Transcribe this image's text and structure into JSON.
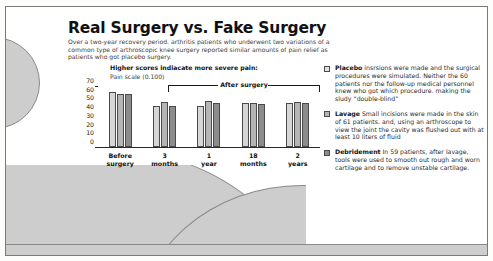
{
  "header": {
    "title": "Real Surgery vs. Fake Surgery",
    "subtitle": "Over a two-year recovery period. arthritis patients who underwent two variations of a common type of arthroscopic knee surgery reported similar amounts of pain relief as patients who got placebo surgery."
  },
  "notes": {
    "scores": "Higher scores indiacate more severe pain:",
    "scale": "Pain scale (0.100)",
    "bracket_label": "After surgery"
  },
  "chart_data": {
    "type": "bar",
    "title": "Real Surgery vs. Fake Surgery",
    "xlabel": "",
    "ylabel": "Pain scale (0.100)",
    "ylim": [
      0,
      70
    ],
    "yticks": [
      0,
      10,
      20,
      30,
      40,
      50,
      60,
      70
    ],
    "grid": false,
    "legend_position": "right",
    "categories": [
      "Before surgery",
      "3 months",
      "1 year",
      "18 months",
      "2 years"
    ],
    "category_lines": [
      [
        "Before",
        "surgery"
      ],
      [
        "3",
        "months"
      ],
      [
        "1",
        "year"
      ],
      [
        "18",
        "months"
      ],
      [
        "2",
        "years"
      ]
    ],
    "series": [
      {
        "name": "Placebo",
        "color": "#d6d6d6",
        "values": [
          64,
          48,
          48,
          51,
          51
        ]
      },
      {
        "name": "Lavage",
        "color": "#b5b5b5",
        "values": [
          62,
          52,
          54,
          51,
          52
        ]
      },
      {
        "name": "Debridement",
        "color": "#8c8c8c",
        "values": [
          62,
          48,
          51,
          50,
          51
        ]
      }
    ]
  },
  "legend": [
    {
      "name": "Placebo",
      "color": "#e2e2e2",
      "body": " insrsions were made and the surgical procedures were simulated. Neither the 60 patients nor the follow-up medical personnel knew who got which procedure. making the sludy “double-blind”"
    },
    {
      "name": "Lavage",
      "color": "#b5b5b5",
      "body": " Small incisions were made in the skin of 61 patients. and, using an arthroscope to view the joint the cavity was flushed out with at least 10 liters of fluid"
    },
    {
      "name": "Debridement",
      "color": "#8c8c8c",
      "body": " In 59 patients, after lavage, tools were used to smooth out rough and worn cartilage and to remove unstable cartilage."
    }
  ]
}
